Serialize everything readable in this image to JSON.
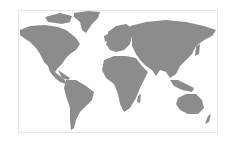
{
  "map": {
    "type": "world-map",
    "projection": "equirectangular-like",
    "land_color": "#8c8c8c",
    "water_color": "#ffffff",
    "border_color": "#e6e6e6",
    "highlighted_regions": [],
    "continents": [
      "North America",
      "South America",
      "Europe",
      "Africa",
      "Asia",
      "Australia",
      "Greenland"
    ]
  }
}
